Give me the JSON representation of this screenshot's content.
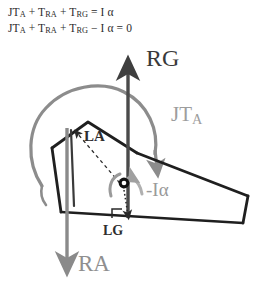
{
  "figure": {
    "equations": [
      {
        "id": "equation-1",
        "text": "JTₐ + Tᴿᴬ + Tᴿᴳ = I α",
        "html": "JT<sub>A</sub> + T<sub>RA</sub> + T<sub>RG</sub> = I α"
      },
      {
        "id": "equation-2",
        "text": "JTₐ + Tᴿᴬ + Tᴿᴳ − I α = 0",
        "html": "JT<sub>A</sub> + T<sub>RA</sub> + T<sub>RG</sub> − I α = 0"
      }
    ],
    "labels": {
      "rg": {
        "text": "RG",
        "meaning": "reaction-force-at-G",
        "color": "#3a3a3a"
      },
      "jta": {
        "text": "JT",
        "sub": "A",
        "meaning": "joint-torque-at-A",
        "color": "#9d9d9d"
      },
      "la": {
        "text": "LA",
        "meaning": "moment-arm-to-A",
        "color": "#2e2e2e"
      },
      "i_alpha": {
        "text": "-Iα",
        "meaning": "negative-inertial-moment",
        "color": "#9a9a9a"
      },
      "lg": {
        "text": "LG",
        "meaning": "moment-arm-to-G",
        "color": "#2e2e2e"
      },
      "ra": {
        "text": "RA",
        "meaning": "reaction-force-at-A",
        "color": "#8f8f8f"
      }
    },
    "colors": {
      "outline_dark": "#1f1f1f",
      "force_gray": "#8a8a8a",
      "force_dark_gray": "#4a4a4a",
      "arc_gray": "#8c8c8c",
      "background": "#ffffff",
      "text_dark": "#2b2b2b"
    },
    "elements": {
      "body_outline": "wedge-polygon",
      "rg_arrow": "vertical-up-arrow-dark",
      "ra_arrow": "vertical-down-arrow-gray",
      "jta_arc": "large-clockwise-arc-arrow-gray",
      "ialpha_arc": "small-counterclockwise-arc-arrow-gray",
      "cg_marker": "center-of-gravity-dot",
      "la_dim": "dashed-leader-line",
      "lg_dim": "dotted-leader-line",
      "right_angle_1": "right-angle-tick-at-LG",
      "right_angle_2": "right-angle-tick-at-base"
    }
  }
}
